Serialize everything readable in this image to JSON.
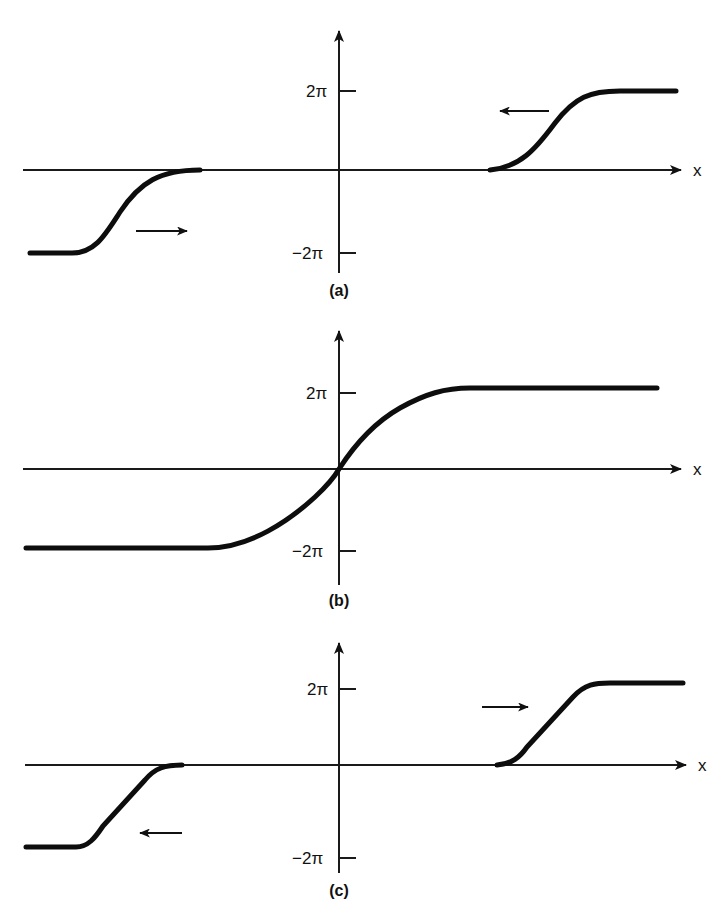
{
  "figure": {
    "axis": {
      "x_label": "x",
      "y_tick_labels": [
        "2π",
        "−2π"
      ]
    },
    "panels": [
      {
        "label": "(a)",
        "note": "Kink at right moving left, antikink at left moving right",
        "curves": [
          {
            "from": "−2π",
            "to": "0",
            "position": "left",
            "arrow": "right"
          },
          {
            "from": "0",
            "to": "2π",
            "position": "right",
            "arrow": "left"
          }
        ]
      },
      {
        "label": "(b)",
        "note": "Single combined kink from −2π to 2π passing through origin",
        "curves": [
          {
            "from": "−2π",
            "to": "2π",
            "position": "center",
            "arrow": "none"
          }
        ]
      },
      {
        "label": "(c)",
        "note": "Kinks separating: right one moving right, left one moving left",
        "curves": [
          {
            "from": "−2π",
            "to": "0",
            "position": "left",
            "arrow": "left"
          },
          {
            "from": "0",
            "to": "2π",
            "position": "right",
            "arrow": "right"
          }
        ]
      }
    ]
  },
  "colors": {
    "background": "#ffffff",
    "ink": "#111111"
  }
}
